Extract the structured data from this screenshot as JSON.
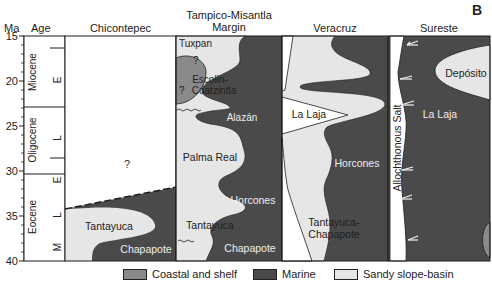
{
  "panel_label": "B",
  "axis": {
    "title": "Ma",
    "ticks": [
      "15",
      "20",
      "25",
      "30",
      "35",
      "40"
    ],
    "age_title": "Age"
  },
  "columns": [
    {
      "id": "chicontepec",
      "title": "Chicontepec"
    },
    {
      "id": "tampico",
      "title": "Tampico-Misantla\nMargin",
      "line1": "Tampico-Misantla",
      "line2": "Margin"
    },
    {
      "id": "veracruz",
      "title": "Veracruz"
    },
    {
      "id": "sureste",
      "title": "Sureste"
    }
  ],
  "epochs": [
    {
      "name": "Miocene",
      "sub": [
        "E"
      ]
    },
    {
      "name": "Oligocene",
      "sub": [
        "L",
        "E"
      ]
    },
    {
      "name": "Eocene",
      "sub": [
        "L",
        "M"
      ]
    }
  ],
  "labels": {
    "chicontepec": {
      "q": "?",
      "tantayuca": "Tantayuca",
      "chapapote": "Chapapote"
    },
    "tampico": {
      "tuxpan": "Tuxpan",
      "q1": "?",
      "q2": "?",
      "escolin1": "Escolin-",
      "escolin2": "Coatzintla",
      "alazan": "Alazán",
      "palma": "Palma Real",
      "horcones": "Horcones",
      "tantayuca": "Tantayuca",
      "chapapote": "Chapapote"
    },
    "veracruz": {
      "lalaja": "La Laja",
      "horcones": "Horcones",
      "tc1": "Tantayuca-",
      "tc2": "Chapapote"
    },
    "sureste": {
      "deposito": "Depósito",
      "lalaja": "La Laja",
      "salt": "Allochthonous Salt"
    }
  },
  "legend": [
    {
      "label": "Coastal and shelf",
      "color": "#8a8a8a"
    },
    {
      "label": "Marine",
      "color": "#4a4a4a"
    },
    {
      "label": "Sandy slope-basin",
      "color": "#e6e6e6"
    }
  ],
  "colors": {
    "marine": "#4a4a4a",
    "sandy": "#e6e6e6",
    "coastal": "#8a8a8a",
    "line": "#1e1e1e"
  }
}
